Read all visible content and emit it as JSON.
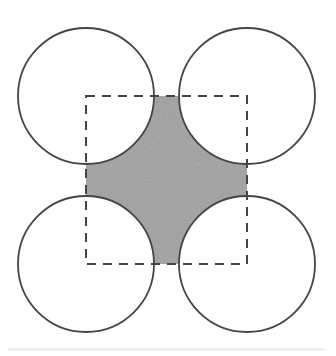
{
  "figure": {
    "canvas": {
      "width": 336,
      "height": 356
    },
    "colors": {
      "background": "#ffffff",
      "line": "#454545",
      "shade": "#b5b5b5"
    },
    "square": {
      "x": 86,
      "y": 96,
      "width": 161,
      "height": 168,
      "dash": "9 7",
      "stroke_width": 2
    },
    "circle_radius": 68,
    "circle_stroke_width": 1.8,
    "circles": [
      {
        "name": "top-left",
        "cx": 86,
        "cy": 96
      },
      {
        "name": "top-right",
        "cx": 247,
        "cy": 96
      },
      {
        "name": "bottom-left",
        "cx": 86,
        "cy": 264
      },
      {
        "name": "bottom-right",
        "cx": 247,
        "cy": 264
      }
    ],
    "grain_opacity": 0.16,
    "scan_artifact": {
      "x": 8,
      "y": 348,
      "width": 316,
      "height": 3,
      "color": "#9a9a9a",
      "opacity": 0.18
    }
  }
}
